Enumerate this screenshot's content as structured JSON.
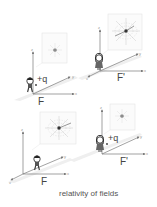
{
  "caption": "relativity of fields",
  "colors": {
    "axis": "#7a7a7a",
    "plane": "#e4e4e4",
    "panel_border": "#e2e2e2",
    "field_lines": "#b5b5b5",
    "charge": "#333333",
    "text": "#444444"
  },
  "panels": [
    {
      "id": "top-left",
      "frame_label": "F",
      "charge_label": "+q",
      "observer": "boy",
      "field_inset": "electric-field-static",
      "axes": [
        "x",
        "y",
        "z"
      ]
    },
    {
      "id": "top-right",
      "frame_label": "F'",
      "charge_label": "",
      "observer": "girl",
      "field_inset": "electric-and-magnetic-field-moving",
      "axes": [
        "x",
        "y",
        "z",
        "v"
      ]
    },
    {
      "id": "bottom-left",
      "frame_label": "F",
      "charge_label": "",
      "observer": "boy",
      "field_inset": "electric-and-magnetic-field-moving",
      "axes": [
        "x",
        "y",
        "z",
        "v"
      ]
    },
    {
      "id": "bottom-right",
      "frame_label": "F'",
      "charge_label": "+q",
      "observer": "girl",
      "field_inset": "electric-field-static",
      "axes": [
        "x",
        "y",
        "z"
      ]
    }
  ],
  "axis_letters": {
    "x": "x",
    "y": "y",
    "z": "z",
    "v": "v"
  }
}
